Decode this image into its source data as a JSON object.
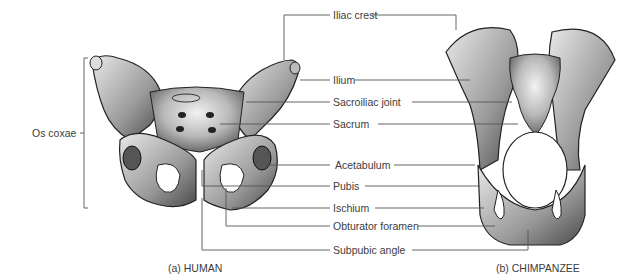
{
  "figure": {
    "labels": {
      "iliac_crest": "Iliac crest",
      "ilium": "Ilium",
      "sacroiliac_joint": "Sacroiliac joint",
      "sacrum": "Sacrum",
      "acetabulum": "Acetabulum",
      "pubis": "Pubis",
      "ischium": "Ischium",
      "obturator_foramen": "Obturator foramen",
      "subpubic_angle": "Subpubic angle",
      "os_coxae": "Os coxae"
    },
    "captions": {
      "human": "(a) HUMAN",
      "chimpanzee": "(b) CHIMPANZEE"
    }
  }
}
